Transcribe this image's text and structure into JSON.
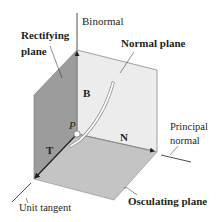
{
  "diagram": {
    "colors": {
      "background": "#ffffff",
      "rectifying_plane": "#9c9c9c",
      "normal_plane": "#ececec",
      "osculating_plane": "#c4c4c4",
      "edge": "#6a6a6a",
      "axis": "#231f20",
      "curve": "#ffffff",
      "curve_outline": "#8a8a8a"
    },
    "labels": {
      "binormal": "Binormal",
      "rectifying_plane_line1": "Rectifying",
      "rectifying_plane_line2": "plane",
      "normal_plane": "Normal plane",
      "principal_normal_line1": "Principal",
      "principal_normal_line2": "normal",
      "unit_tangent": "Unit tangent",
      "osculating_plane": "Osculating plane"
    },
    "vectors": {
      "B": "B",
      "N": "N",
      "T": "T"
    },
    "point": {
      "name": "P"
    }
  }
}
